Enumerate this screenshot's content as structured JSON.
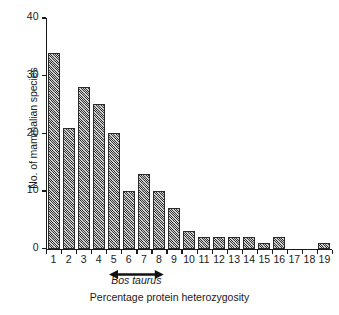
{
  "chart_data": {
    "type": "bar",
    "title": "",
    "xlabel": "Percentage protein heterozygosity",
    "ylabel": "No. of mammalian species",
    "categories": [
      "1",
      "2",
      "3",
      "4",
      "5",
      "6",
      "7",
      "8",
      "9",
      "10",
      "11",
      "12",
      "13",
      "14",
      "15",
      "16",
      "17",
      "18",
      "19"
    ],
    "values": [
      34,
      21,
      28,
      25,
      20,
      10,
      13,
      10,
      7,
      3,
      2,
      2,
      2,
      2,
      1,
      2,
      0,
      0,
      1
    ],
    "ylim": [
      0,
      40
    ],
    "yticks": [
      0,
      10,
      20,
      30,
      40
    ],
    "ytick_labels": [
      "0",
      "10",
      "20",
      "30",
      "40"
    ],
    "grid": false,
    "legend": null,
    "bar_fill": "#8d8d8d",
    "bar_edge": "#2b2b2b",
    "background": "#ffffff",
    "annotations": [
      {
        "text": "Bos taurus",
        "style": "italic",
        "marker": "double-headed-arrow",
        "span_categories": [
          "5",
          "8"
        ]
      }
    ]
  },
  "axes": {
    "y_title": "No. of mammalian species",
    "x_title": "Percentage protein heterozygosity"
  }
}
